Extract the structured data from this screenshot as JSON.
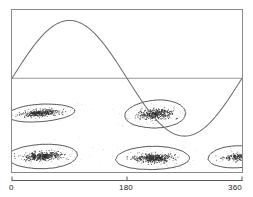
{
  "figure": {
    "title": "",
    "background_color": "#ffffff",
    "frame_color": "#8a8a8a",
    "curve_color": "#6e6e6e",
    "ellipse_color": "#3a3a3a",
    "point_color": "#2b2b2b",
    "axis_color": "#5a5a5a",
    "label_color": "#1d1d1d"
  },
  "axis": {
    "x_ticks": [
      {
        "label": "0",
        "value": 0
      },
      {
        "label": "180",
        "value": 180
      },
      {
        "label": "360",
        "value": 360
      }
    ],
    "x_min": 0,
    "x_max": 360,
    "x_axis_label": "",
    "y_axis_label": "",
    "y_ticks": []
  },
  "chart_data": {
    "type": "scatter",
    "title": "",
    "subtitle": "",
    "xlabel": "",
    "ylabel": "",
    "xlim": [
      0,
      360
    ],
    "ylim": [
      0,
      1
    ],
    "grid": false,
    "legend": null,
    "legend_position": "none",
    "annotations": [],
    "series": [
      {
        "name": "sine-curve",
        "type": "line",
        "description": "single sinusoid spanning the full phase range, peak near 90 deg, trough near 270 deg",
        "amplitude": 1.0,
        "period_degrees": 360,
        "phase_offset_degrees": 0,
        "baseline_y": 0.0,
        "x": [
          0,
          30,
          60,
          90,
          120,
          150,
          180,
          210,
          240,
          270,
          300,
          330,
          360
        ],
        "y": [
          0.0,
          0.5,
          0.866,
          1.0,
          0.866,
          0.5,
          0.0,
          -0.5,
          -0.866,
          -1.0,
          -0.866,
          -0.5,
          0.0
        ]
      },
      {
        "name": "zero-line",
        "type": "line",
        "description": "horizontal reference line at amplitude zero",
        "x": [
          0,
          360
        ],
        "y": [
          0.0,
          0.0
        ]
      },
      {
        "name": "point-clusters",
        "type": "scatter",
        "description": "dense point clouds grouped into ellipse-outlined clusters in two rows",
        "n_clusters": 5,
        "clusters": [
          {
            "id": "cluster-upper-left",
            "row": "upper",
            "center_phase_degrees": 45,
            "center_y": -0.6,
            "width_degrees": 105,
            "height_y": 0.3,
            "rotation_degrees": -4,
            "n_points": 420,
            "density": "high"
          },
          {
            "id": "cluster-upper-right",
            "row": "upper",
            "center_phase_degrees": 225,
            "center_y": -0.62,
            "width_degrees": 95,
            "height_y": 0.48,
            "rotation_degrees": -3,
            "n_points": 470,
            "density": "high"
          },
          {
            "id": "cluster-lower-left",
            "row": "lower",
            "center_phase_degrees": 48,
            "center_y": -1.35,
            "width_degrees": 110,
            "height_y": 0.42,
            "rotation_degrees": -2,
            "n_points": 520,
            "density": "high"
          },
          {
            "id": "cluster-lower-middle",
            "row": "lower",
            "center_phase_degrees": 220,
            "center_y": -1.38,
            "width_degrees": 115,
            "height_y": 0.4,
            "rotation_degrees": -1,
            "n_points": 540,
            "density": "high"
          },
          {
            "id": "cluster-lower-right",
            "row": "lower",
            "center_phase_degrees": 352,
            "center_y": -1.36,
            "width_degrees": 90,
            "height_y": 0.38,
            "rotation_degrees": -2,
            "n_points": 240,
            "density": "medium",
            "clipped_at_right_edge": true
          }
        ]
      }
    ]
  }
}
